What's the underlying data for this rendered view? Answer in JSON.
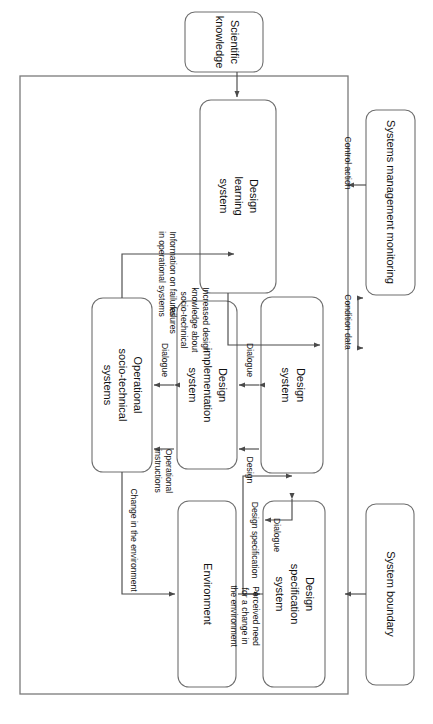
{
  "figure": {
    "orientation": "rotated-90-clockwise",
    "background_color": "#ffffff",
    "line_color": "#4a4a4a",
    "box_stroke_color": "#6e6e6e",
    "boundary_stroke_color": "#7a7a7a",
    "text_color": "#111111"
  },
  "nodes": {
    "scientific_knowledge": {
      "label": "Scientific\nknowledge",
      "line1": "Scientific",
      "line2": "knowledge"
    },
    "design_learning_system": {
      "label": "Design\nlearning\nsystem",
      "line1": "Design",
      "line2": "learning",
      "line3": "system"
    },
    "systems_management_monitoring": {
      "label": "Systems management monitoring",
      "line1": "Systems management monitoring"
    },
    "design_system": {
      "label": "Design\nsystem",
      "line1": "Design",
      "line2": "system"
    },
    "design_implementation_system": {
      "label": "Design\nimplementation\nsystem",
      "line1": "Design",
      "line2": "implementation",
      "line3": "system"
    },
    "operational_socio_technical_systems": {
      "label": "Operational\nsocio-technical\nsystems",
      "line1": "Operational",
      "line2": "socio-technical",
      "line3": "systems"
    },
    "design_specification_system": {
      "label": "Design\nspecification\nsystem",
      "line1": "Design",
      "line2": "specification",
      "line3": "system"
    },
    "environment": {
      "label": "Environment",
      "line1": "Environment"
    },
    "system_boundary": {
      "label": "System boundary",
      "line1": "System boundary"
    }
  },
  "edge_labels": {
    "condition_data": {
      "line1": "Condition data"
    },
    "control_action": {
      "line1": "Control action"
    },
    "increased_design_knowledge": {
      "line1": "Increased design",
      "line2": "knowledge about",
      "line3": "socio-technical",
      "line4": "failures"
    },
    "information_on_failures": {
      "line1": "Information on failures",
      "line2": "in operational systems"
    },
    "dialogue_left": {
      "line1": "Dialogue"
    },
    "dialogue_right": {
      "line1": "Dialogue"
    },
    "design": {
      "line1": "Design"
    },
    "operational_instructions": {
      "line1": "Operational",
      "line2": "instructions"
    },
    "design_specification": {
      "line1": "Design specification"
    },
    "dialogue_spec": {
      "line1": "Dialogue"
    },
    "perceived_need": {
      "line1": "Perceived need",
      "line2": "for a change in",
      "line3": "the environment"
    },
    "change_in_environment": {
      "line1": "Change in the environment"
    }
  }
}
